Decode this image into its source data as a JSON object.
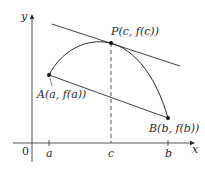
{
  "diagram": {
    "axes": {
      "x_label": "x",
      "y_label": "y",
      "origin_label": "0"
    },
    "ticks": [
      {
        "label": "a",
        "x": 49
      },
      {
        "label": "c",
        "x": 111
      },
      {
        "label": "b",
        "x": 168
      }
    ],
    "points": {
      "A": {
        "label": "A(a, f(a))",
        "x": 49,
        "y": 75
      },
      "P": {
        "label": "P(c, f(c))",
        "x": 111,
        "y": 43
      },
      "B": {
        "label": "B(b, f(b))",
        "x": 168,
        "y": 118
      }
    },
    "lines": {
      "tangent": "tangent line at P, parallel to secant AB",
      "secant": "secant line AB",
      "dashed": "vertical dashed line from P to x-axis at c"
    },
    "colors": {
      "stroke": "#2a2a2a",
      "background": "#ffffff"
    }
  }
}
